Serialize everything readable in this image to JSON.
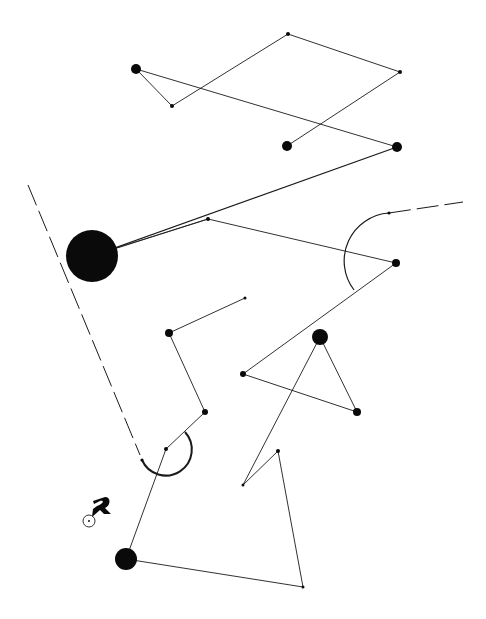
{
  "diagram": {
    "background": "#ffffff",
    "stroke_color": "#1a1a1a",
    "node_color": "#0a0a0a",
    "nodes": [
      {
        "id": "A",
        "x": 136,
        "y": 69,
        "r": 5
      },
      {
        "id": "B",
        "x": 172,
        "y": 106,
        "r": 2
      },
      {
        "id": "C",
        "x": 288,
        "y": 34,
        "r": 2
      },
      {
        "id": "D",
        "x": 400,
        "y": 72,
        "r": 2
      },
      {
        "id": "E",
        "x": 287,
        "y": 146,
        "r": 5
      },
      {
        "id": "F",
        "x": 397,
        "y": 147,
        "r": 5
      },
      {
        "id": "G",
        "x": 92,
        "y": 256,
        "r": 26
      },
      {
        "id": "H",
        "x": 208,
        "y": 219,
        "r": 2
      },
      {
        "id": "I",
        "x": 396,
        "y": 263,
        "r": 4
      },
      {
        "id": "J",
        "x": 169,
        "y": 333,
        "r": 4
      },
      {
        "id": "K",
        "x": 245,
        "y": 298,
        "r": 1.5
      },
      {
        "id": "L",
        "x": 205,
        "y": 412,
        "r": 3
      },
      {
        "id": "M",
        "x": 166,
        "y": 449,
        "r": 2
      },
      {
        "id": "N",
        "x": 320,
        "y": 337,
        "r": 8
      },
      {
        "id": "O",
        "x": 243,
        "y": 374,
        "r": 3
      },
      {
        "id": "P",
        "x": 357,
        "y": 412,
        "r": 4
      },
      {
        "id": "Q",
        "x": 243,
        "y": 485,
        "r": 1.5
      },
      {
        "id": "R",
        "x": 278,
        "y": 451,
        "r": 2
      },
      {
        "id": "S",
        "x": 303,
        "y": 587,
        "r": 1.5
      },
      {
        "id": "T",
        "x": 126,
        "y": 559,
        "r": 11
      }
    ],
    "edges": [
      [
        "A",
        "B"
      ],
      [
        "B",
        "C"
      ],
      [
        "C",
        "D"
      ],
      [
        "D",
        "E"
      ],
      [
        "A",
        "F"
      ],
      [
        "F",
        "G"
      ],
      [
        "G",
        "H"
      ],
      [
        "H",
        "I"
      ],
      [
        "I",
        "O"
      ],
      [
        "O",
        "P"
      ],
      [
        "P",
        "N"
      ],
      [
        "N",
        "Q"
      ],
      [
        "Q",
        "R"
      ],
      [
        "R",
        "S"
      ],
      [
        "S",
        "T"
      ],
      [
        "T",
        "M"
      ],
      [
        "M",
        "L"
      ],
      [
        "L",
        "J"
      ],
      [
        "J",
        "K"
      ]
    ],
    "dashed_paths": [
      {
        "id": "left-dashed-guide",
        "d": "M28,185 L140,455"
      },
      {
        "id": "right-dashed-guide",
        "d": "M389,213 L463,202"
      }
    ],
    "arcs": [
      {
        "id": "arc-around-I",
        "d": "M389,213 A48,48 0 0 0 354,290",
        "width": 1.2
      },
      {
        "id": "arc-around-M",
        "d": "M185,432 A26,26 0 1 1 142,460",
        "width": 2
      }
    ],
    "marker": {
      "x": 89,
      "y": 521,
      "r": 6,
      "label": "start-marker"
    }
  }
}
